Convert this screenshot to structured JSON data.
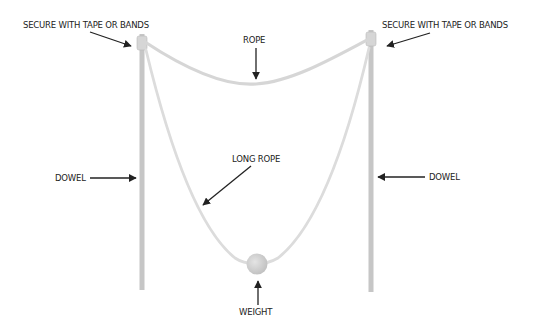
{
  "labels": {
    "secure_left": "SECURE WITH TAPE OR BANDS",
    "secure_right": "SECURE WITH TAPE OR BANDS",
    "rope": "ROPE",
    "long_rope": "LONG ROPE",
    "dowel_left": "DOWEL",
    "dowel_right": "DOWEL",
    "weight": "WEIGHT"
  },
  "colors": {
    "dowel": "#c4c4c4",
    "rope": "#d8d8d8",
    "weight": "#cfcfcf",
    "arrow": "#222222",
    "text": "#222222"
  }
}
